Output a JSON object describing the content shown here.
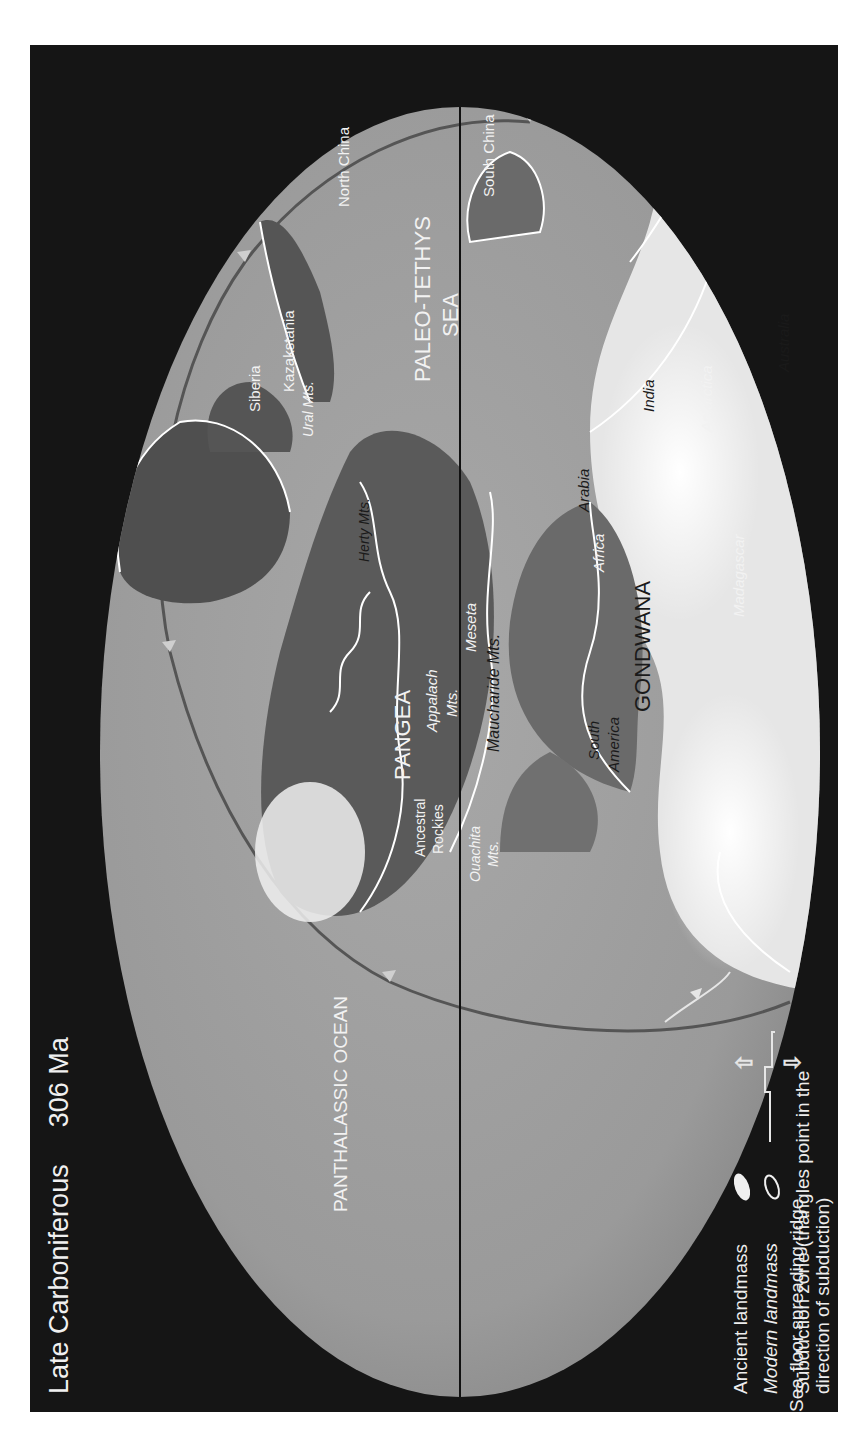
{
  "header": {
    "period": "Late Carboniferous",
    "age": "306 Ma"
  },
  "oceans": {
    "panthalassic": "PANTHALASSIC OCEAN",
    "paleo_tethys_1": "PALEO-TETHYS",
    "paleo_tethys_2": "SEA"
  },
  "supercontinents": {
    "pangea": "PANGEA",
    "gondwana": "GONDWANA"
  },
  "landmasses": {
    "siberia": "Siberia",
    "kazakstania": "Kazakstania",
    "north_china": "North China",
    "south_china": "South China",
    "australia": "Australia",
    "india": "India",
    "arabia": "Arabia",
    "antarctica": "Antarctica",
    "madagascar": "Madagascar",
    "africa": "Africa",
    "south_america_1": "South",
    "south_america_2": "America",
    "meseta": "Meseta"
  },
  "mountains": {
    "urals": "Ural Mts.",
    "hercynian": "Herty Mts.",
    "appalach_1": "Appalach",
    "appalach_2": "Mts.",
    "mauchanide": "Maucharide Mts.",
    "ancestral_1": "Ancestral",
    "ancestral_2": "Rockies",
    "ouachita_1": "Ouachita",
    "ouachita_2": "Mts."
  },
  "legend": {
    "ancient": "Ancient landmass",
    "modern": "Modern landmass",
    "subduction_1": "Subduction zone (triangles point in the",
    "subduction_2": "direction of subduction)",
    "ridge": "Sea-floor spreading ridge"
  },
  "colors": {
    "frame": "#151515",
    "ocean": "#9a9a9a",
    "ancient_land_dark": "#5e5e5e",
    "highland": "#eeeeee",
    "outline": "#ffffff"
  }
}
